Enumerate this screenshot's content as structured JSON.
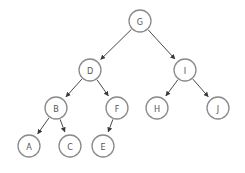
{
  "diagram": {
    "type": "binary-tree",
    "node_radius": 11,
    "colors": {
      "node_stroke": "#8a8a8a",
      "label": "#555555",
      "edge": "#4a4a4a",
      "background": "#ffffff"
    },
    "nodes": [
      {
        "id": "G",
        "label": "G",
        "x": 140,
        "y": 21
      },
      {
        "id": "D",
        "label": "D",
        "x": 90,
        "y": 70
      },
      {
        "id": "I",
        "label": "I",
        "x": 185,
        "y": 70
      },
      {
        "id": "B",
        "label": "B",
        "x": 56,
        "y": 108
      },
      {
        "id": "F",
        "label": "F",
        "x": 117,
        "y": 108
      },
      {
        "id": "H",
        "label": "H",
        "x": 157,
        "y": 108
      },
      {
        "id": "J",
        "label": "J",
        "x": 218,
        "y": 108
      },
      {
        "id": "A",
        "label": "A",
        "x": 29,
        "y": 146
      },
      {
        "id": "C",
        "label": "C",
        "x": 70,
        "y": 146
      },
      {
        "id": "E",
        "label": "E",
        "x": 103,
        "y": 146
      }
    ],
    "edges": [
      {
        "from": "G",
        "to": "D"
      },
      {
        "from": "G",
        "to": "I"
      },
      {
        "from": "D",
        "to": "B"
      },
      {
        "from": "D",
        "to": "F"
      },
      {
        "from": "I",
        "to": "H"
      },
      {
        "from": "I",
        "to": "J"
      },
      {
        "from": "B",
        "to": "A"
      },
      {
        "from": "B",
        "to": "C"
      },
      {
        "from": "F",
        "to": "E"
      }
    ]
  }
}
